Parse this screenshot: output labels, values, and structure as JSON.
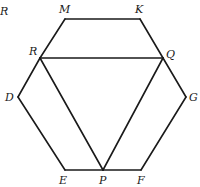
{
  "diagram": {
    "type": "geometry",
    "corner_label": {
      "text": "R",
      "x": 0,
      "y": 15
    },
    "points": {
      "M": {
        "label": "M",
        "x": 65,
        "y": 19,
        "lx": 59,
        "ly": 13
      },
      "K": {
        "label": "K",
        "x": 140,
        "y": 19,
        "lx": 135,
        "ly": 13
      },
      "Q": {
        "label": "Q",
        "x": 163,
        "y": 58,
        "lx": 166,
        "ly": 58
      },
      "G": {
        "label": "G",
        "x": 186,
        "y": 97,
        "lx": 189,
        "ly": 101
      },
      "F": {
        "label": "F",
        "x": 141,
        "y": 170,
        "lx": 137,
        "ly": 184
      },
      "P": {
        "label": "P",
        "x": 103,
        "y": 170,
        "lx": 99,
        "ly": 184
      },
      "E": {
        "label": "E",
        "x": 65,
        "y": 170,
        "lx": 59,
        "ly": 184
      },
      "D": {
        "label": "D",
        "x": 18,
        "y": 97,
        "lx": 5,
        "ly": 101
      },
      "R": {
        "label": "R",
        "x": 40,
        "y": 58,
        "lx": 29,
        "ly": 55
      }
    },
    "segments": [
      [
        "M",
        "K"
      ],
      [
        "K",
        "Q"
      ],
      [
        "Q",
        "G"
      ],
      [
        "G",
        "F"
      ],
      [
        "F",
        "P"
      ],
      [
        "P",
        "E"
      ],
      [
        "E",
        "D"
      ],
      [
        "D",
        "R"
      ],
      [
        "R",
        "M"
      ],
      [
        "R",
        "Q"
      ],
      [
        "R",
        "P"
      ],
      [
        "Q",
        "P"
      ]
    ]
  }
}
